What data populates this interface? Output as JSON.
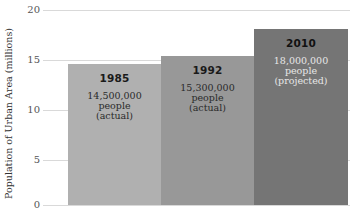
{
  "chart_data": {
    "type": "bar",
    "title": "",
    "xlabel": "",
    "ylabel": "Population of Urban Area (millions)",
    "ylim": [
      0,
      20
    ],
    "yticks": [
      0,
      5,
      10,
      15,
      20
    ],
    "grid": true,
    "legend": null,
    "categories": [
      "1985",
      "1992",
      "2010"
    ],
    "values": [
      14.5,
      15.3,
      18.0
    ],
    "bar_labels": [
      {
        "year": "1985",
        "lines": [
          "14,500,000",
          "people",
          "(actual)"
        ]
      },
      {
        "year": "1992",
        "lines": [
          "15,300,000",
          "people",
          "(actual)"
        ]
      },
      {
        "year": "2010",
        "lines": [
          "18,000,000",
          "people",
          "(projected)"
        ]
      }
    ],
    "colors": [
      "#b0b0b0",
      "#989898",
      "#757575"
    ]
  },
  "axis": {
    "ylabel": "Population of Urban Area (millions)",
    "ticks": [
      "20",
      "15",
      "10",
      "5",
      "0"
    ]
  },
  "bars": [
    {
      "year": "1985",
      "line1": "14,500,000",
      "line2": "people",
      "line3": "(actual)",
      "color": "#b0b0b0"
    },
    {
      "year": "1992",
      "line1": "15,300,000",
      "line2": "people",
      "line3": "(actual)",
      "color": "#989898"
    },
    {
      "year": "2010",
      "line1": "18,000,000",
      "line2": "people",
      "line3": "(projected)",
      "color": "#757575"
    }
  ]
}
